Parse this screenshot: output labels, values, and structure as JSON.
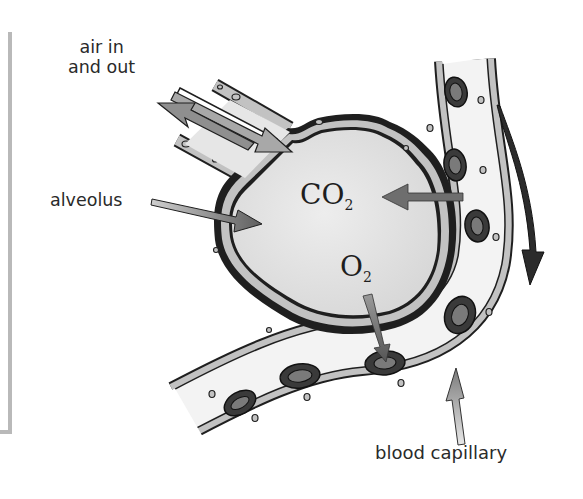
{
  "diagram": {
    "labels": {
      "air_line1": "air in",
      "air_line2": "and out",
      "alveolus": "alveolus",
      "blood_capillary": "blood capillary"
    },
    "gases": {
      "co2_main": "CO",
      "co2_sub": "2",
      "o2_main": "O",
      "o2_sub": "2"
    },
    "arrows": [
      {
        "name": "air-in-arrow",
        "direction": "into alveolus"
      },
      {
        "name": "air-out-arrow",
        "direction": "out of alveolus"
      },
      {
        "name": "co2-arrow",
        "direction": "capillary to alveolus"
      },
      {
        "name": "o2-arrow",
        "direction": "alveolus to red blood cell"
      },
      {
        "name": "blood-flow-arrow",
        "direction": "downward along capillary"
      }
    ],
    "colors": {
      "outline": "#1f1f1f",
      "wall_fill": "#bdbdbd",
      "alveolus_fill": "#e4e4e4",
      "capillary_fill": "#f2f2f2",
      "rbc_outer": "#3a3a3a",
      "rbc_inner": "#7a7a7a",
      "arrow_gray": "#6e6e6e",
      "arrow_light": "#b5b5b5",
      "flow_arrow": "#2b2b2b",
      "frame_bar": "#b9b9b9"
    }
  }
}
